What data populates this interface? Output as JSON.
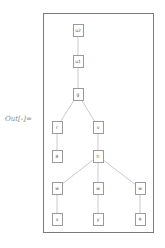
{
  "output_label": "Out[-]=",
  "graph": {
    "type": "tree",
    "edge_color": "#bdbdbd",
    "node_border_color": "#9a9a9a",
    "frame_color": "#7a7a7a",
    "nodes": [
      {
        "id": "n0",
        "label": "u2",
        "x": 78,
        "y": 30
      },
      {
        "id": "n1",
        "label": "u1",
        "x": 78,
        "y": 61
      },
      {
        "id": "n2",
        "label": "g",
        "x": 78,
        "y": 94
      },
      {
        "id": "n3",
        "label": "r",
        "x": 57,
        "y": 127
      },
      {
        "id": "n4",
        "label": "v",
        "x": 98,
        "y": 127
      },
      {
        "id": "n5",
        "label": "8",
        "x": 57,
        "y": 156
      },
      {
        "id": "n6",
        "label": "h",
        "x": 98,
        "y": 156
      },
      {
        "id": "n7",
        "label": "w",
        "x": 57,
        "y": 188
      },
      {
        "id": "n8",
        "label": "w",
        "x": 98,
        "y": 188
      },
      {
        "id": "n9",
        "label": "w",
        "x": 140,
        "y": 188
      },
      {
        "id": "n10",
        "label": "x",
        "x": 57,
        "y": 219
      },
      {
        "id": "n11",
        "label": "y",
        "x": 98,
        "y": 219
      },
      {
        "id": "n12",
        "label": "9",
        "x": 140,
        "y": 219
      }
    ],
    "edges": [
      [
        "n0",
        "n1"
      ],
      [
        "n1",
        "n2"
      ],
      [
        "n2",
        "n3"
      ],
      [
        "n2",
        "n4"
      ],
      [
        "n3",
        "n5"
      ],
      [
        "n4",
        "n6"
      ],
      [
        "n6",
        "n7"
      ],
      [
        "n6",
        "n8"
      ],
      [
        "n6",
        "n9"
      ],
      [
        "n7",
        "n10"
      ],
      [
        "n8",
        "n11"
      ],
      [
        "n9",
        "n12"
      ]
    ]
  }
}
